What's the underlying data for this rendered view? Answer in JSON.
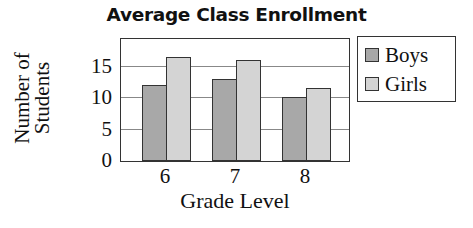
{
  "chart_data": {
    "type": "bar",
    "title": "Average Class Enrollment",
    "xlabel": "Grade Level",
    "ylabel": "Number of Students",
    "categories": [
      "6",
      "7",
      "8"
    ],
    "series": [
      {
        "name": "Boys",
        "values": [
          12,
          13,
          10
        ],
        "color": "#a8a8a8"
      },
      {
        "name": "Girls",
        "values": [
          16.5,
          16,
          11.5
        ],
        "color": "#d4d4d4"
      }
    ],
    "yticks": [
      "0",
      "5",
      "10",
      "15"
    ],
    "ylim": [
      0,
      20
    ],
    "grid": true,
    "legend_position": "right"
  },
  "labels": {
    "title": "Average Class Enrollment",
    "ylabel": "Number of Students",
    "xlabel": "Grade Level",
    "legend": [
      "Boys",
      "Girls"
    ]
  }
}
